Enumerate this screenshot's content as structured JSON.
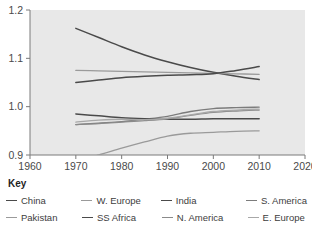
{
  "legend": {
    "title": "Key",
    "rows": [
      [
        {
          "label": "China",
          "color": "#4a4a4a"
        },
        {
          "label": "W. Europe",
          "color": "#9a9a9a"
        },
        {
          "label": "India",
          "color": "#4a4a4a"
        },
        {
          "label": "S. America",
          "color": "#7c7c7c"
        }
      ],
      [
        {
          "label": "Pakistan",
          "color": "#9a9a9a"
        },
        {
          "label": "SS Africa",
          "color": "#4a4a4a"
        },
        {
          "label": "N. America",
          "color": "#8a8a8a"
        },
        {
          "label": "E. Europe",
          "color": "#a8a8a8"
        }
      ]
    ]
  },
  "chart_data": {
    "type": "line",
    "title": "",
    "xlabel": "",
    "ylabel": "",
    "xlim": [
      1960,
      2020
    ],
    "ylim": [
      0.9,
      1.2
    ],
    "xticks": [
      1960,
      1970,
      1980,
      1990,
      2000,
      2010,
      2020
    ],
    "xtick_labels": [
      "1960",
      "1970",
      "1980",
      "1990",
      "2000",
      "2010",
      "2020"
    ],
    "yticks": [
      0.9,
      1.0,
      1.1,
      1.2
    ],
    "ytick_labels": [
      "0.9",
      "1.0",
      "1.1",
      "1.2"
    ],
    "grid": false,
    "legend_position": "below",
    "plot_background": "#e8e8e8",
    "x": [
      1970,
      1975,
      1980,
      1985,
      1990,
      1995,
      2000,
      2005,
      2010
    ],
    "series": [
      {
        "name": "China",
        "color": "#4a4a4a",
        "width": 1.5,
        "values": [
          1.162,
          1.143,
          1.124,
          1.107,
          1.093,
          1.081,
          1.071,
          1.063,
          1.056
        ]
      },
      {
        "name": "W. Europe",
        "color": "#9a9a9a",
        "width": 1.3,
        "values": [
          1.075,
          1.074,
          1.073,
          1.072,
          1.071,
          1.07,
          1.069,
          1.068,
          1.067
        ]
      },
      {
        "name": "India",
        "color": "#4a4a4a",
        "width": 1.5,
        "values": [
          1.05,
          1.055,
          1.06,
          1.063,
          1.065,
          1.066,
          1.068,
          1.075,
          1.083
        ]
      },
      {
        "name": "S. America",
        "color": "#7c7c7c",
        "width": 1.3,
        "values": [
          0.963,
          0.966,
          0.969,
          0.974,
          0.98,
          0.99,
          0.996,
          0.998,
          0.999
        ]
      },
      {
        "name": "Pakistan",
        "color": "#9a9a9a",
        "width": 1.3,
        "values": [
          0.888,
          0.9,
          0.914,
          0.927,
          0.939,
          0.945,
          0.947,
          0.949,
          0.95
        ]
      },
      {
        "name": "SS Africa",
        "color": "#4a4a4a",
        "width": 1.5,
        "values": [
          0.985,
          0.981,
          0.977,
          0.975,
          0.974,
          0.974,
          0.975,
          0.975,
          0.975
        ]
      },
      {
        "name": "N. America",
        "color": "#8a8a8a",
        "width": 1.3,
        "values": [
          0.963,
          0.965,
          0.968,
          0.971,
          0.975,
          0.982,
          0.988,
          0.991,
          0.993
        ]
      },
      {
        "name": "E. Europe",
        "color": "#a8a8a8",
        "width": 1.3,
        "values": [
          0.968,
          0.972,
          0.974,
          0.973,
          0.976,
          0.983,
          0.99,
          0.993,
          0.995
        ]
      }
    ]
  }
}
